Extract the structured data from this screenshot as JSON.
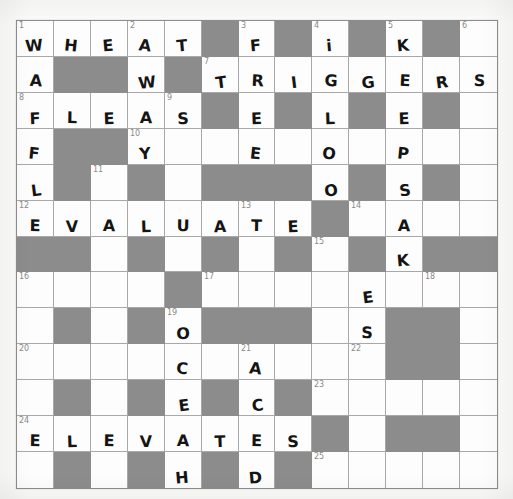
{
  "puzzle": {
    "kind": "crossword-grid",
    "columns": 13,
    "rows": 13,
    "cell_size": 37,
    "colors": {
      "block": "#8c8c8c",
      "open": "#fdfdfd",
      "grid_line": "#a8a8a8",
      "border": "#8d8d8d",
      "number": "#8a8a8a",
      "ink": "#141414",
      "paper": "#fbfbfa"
    },
    "grid": [
      [
        {
          "t": "open",
          "n": "1",
          "l": "W"
        },
        {
          "t": "open",
          "n": "",
          "l": "H"
        },
        {
          "t": "open",
          "n": "",
          "l": "E"
        },
        {
          "t": "open",
          "n": "2",
          "l": "A"
        },
        {
          "t": "open",
          "n": "",
          "l": "T"
        },
        {
          "t": "block",
          "n": "",
          "l": ""
        },
        {
          "t": "open",
          "n": "3",
          "l": "F"
        },
        {
          "t": "block",
          "n": "",
          "l": ""
        },
        {
          "t": "open",
          "n": "4",
          "l": "i"
        },
        {
          "t": "block",
          "n": "",
          "l": ""
        },
        {
          "t": "open",
          "n": "5",
          "l": "K"
        },
        {
          "t": "block",
          "n": "",
          "l": ""
        },
        {
          "t": "open",
          "n": "6",
          "l": ""
        }
      ],
      [
        {
          "t": "open",
          "n": "",
          "l": "A"
        },
        {
          "t": "block",
          "n": "",
          "l": ""
        },
        {
          "t": "block",
          "n": "",
          "l": ""
        },
        {
          "t": "open",
          "n": "",
          "l": "W"
        },
        {
          "t": "block",
          "n": "",
          "l": ""
        },
        {
          "t": "open",
          "n": "7",
          "l": "T"
        },
        {
          "t": "open",
          "n": "",
          "l": "R"
        },
        {
          "t": "open",
          "n": "",
          "l": "I"
        },
        {
          "t": "open",
          "n": "",
          "l": "G"
        },
        {
          "t": "open",
          "n": "",
          "l": "G"
        },
        {
          "t": "open",
          "n": "",
          "l": "E"
        },
        {
          "t": "open",
          "n": "",
          "l": "R"
        },
        {
          "t": "open",
          "n": "",
          "l": "S"
        }
      ],
      [
        {
          "t": "open",
          "n": "8",
          "l": "F"
        },
        {
          "t": "open",
          "n": "",
          "l": "L"
        },
        {
          "t": "open",
          "n": "",
          "l": "E"
        },
        {
          "t": "open",
          "n": "",
          "l": "A"
        },
        {
          "t": "open",
          "n": "9",
          "l": "S"
        },
        {
          "t": "block",
          "n": "",
          "l": ""
        },
        {
          "t": "open",
          "n": "",
          "l": "E"
        },
        {
          "t": "block",
          "n": "",
          "l": ""
        },
        {
          "t": "open",
          "n": "",
          "l": "L"
        },
        {
          "t": "block",
          "n": "",
          "l": ""
        },
        {
          "t": "open",
          "n": "",
          "l": "E"
        },
        {
          "t": "block",
          "n": "",
          "l": ""
        },
        {
          "t": "open",
          "n": "",
          "l": ""
        }
      ],
      [
        {
          "t": "open",
          "n": "",
          "l": "F"
        },
        {
          "t": "block",
          "n": "",
          "l": ""
        },
        {
          "t": "block",
          "n": "",
          "l": ""
        },
        {
          "t": "open",
          "n": "10",
          "l": "Y"
        },
        {
          "t": "open",
          "n": "",
          "l": ""
        },
        {
          "t": "open",
          "n": "",
          "l": ""
        },
        {
          "t": "open",
          "n": "",
          "l": "E"
        },
        {
          "t": "open",
          "n": "",
          "l": ""
        },
        {
          "t": "open",
          "n": "",
          "l": "O"
        },
        {
          "t": "open",
          "n": "",
          "l": ""
        },
        {
          "t": "open",
          "n": "",
          "l": "P"
        },
        {
          "t": "open",
          "n": "",
          "l": ""
        },
        {
          "t": "open",
          "n": "",
          "l": ""
        }
      ],
      [
        {
          "t": "open",
          "n": "",
          "l": "L"
        },
        {
          "t": "block",
          "n": "",
          "l": ""
        },
        {
          "t": "open",
          "n": "11",
          "l": ""
        },
        {
          "t": "block",
          "n": "",
          "l": ""
        },
        {
          "t": "open",
          "n": "",
          "l": ""
        },
        {
          "t": "block",
          "n": "",
          "l": ""
        },
        {
          "t": "block",
          "n": "",
          "l": ""
        },
        {
          "t": "block",
          "n": "",
          "l": ""
        },
        {
          "t": "open",
          "n": "",
          "l": "O"
        },
        {
          "t": "block",
          "n": "",
          "l": ""
        },
        {
          "t": "open",
          "n": "",
          "l": "S"
        },
        {
          "t": "block",
          "n": "",
          "l": ""
        },
        {
          "t": "open",
          "n": "",
          "l": ""
        }
      ],
      [
        {
          "t": "open",
          "n": "12",
          "l": "E"
        },
        {
          "t": "open",
          "n": "",
          "l": "V"
        },
        {
          "t": "open",
          "n": "",
          "l": "A"
        },
        {
          "t": "open",
          "n": "",
          "l": "L"
        },
        {
          "t": "open",
          "n": "",
          "l": "U"
        },
        {
          "t": "open",
          "n": "",
          "l": "A"
        },
        {
          "t": "open",
          "n": "13",
          "l": "T"
        },
        {
          "t": "open",
          "n": "",
          "l": "E"
        },
        {
          "t": "block",
          "n": "",
          "l": ""
        },
        {
          "t": "open",
          "n": "14",
          "l": ""
        },
        {
          "t": "open",
          "n": "",
          "l": "A"
        },
        {
          "t": "open",
          "n": "",
          "l": ""
        },
        {
          "t": "open",
          "n": "",
          "l": ""
        }
      ],
      [
        {
          "t": "block",
          "n": "",
          "l": ""
        },
        {
          "t": "block",
          "n": "",
          "l": ""
        },
        {
          "t": "open",
          "n": "",
          "l": ""
        },
        {
          "t": "block",
          "n": "",
          "l": ""
        },
        {
          "t": "open",
          "n": "",
          "l": ""
        },
        {
          "t": "block",
          "n": "",
          "l": ""
        },
        {
          "t": "open",
          "n": "",
          "l": ""
        },
        {
          "t": "block",
          "n": "",
          "l": ""
        },
        {
          "t": "open",
          "n": "15",
          "l": ""
        },
        {
          "t": "block",
          "n": "",
          "l": ""
        },
        {
          "t": "open",
          "n": "",
          "l": "K"
        },
        {
          "t": "block",
          "n": "",
          "l": ""
        },
        {
          "t": "block",
          "n": "",
          "l": ""
        }
      ],
      [
        {
          "t": "open",
          "n": "16",
          "l": ""
        },
        {
          "t": "open",
          "n": "",
          "l": ""
        },
        {
          "t": "open",
          "n": "",
          "l": ""
        },
        {
          "t": "open",
          "n": "",
          "l": ""
        },
        {
          "t": "block",
          "n": "",
          "l": ""
        },
        {
          "t": "open",
          "n": "17",
          "l": ""
        },
        {
          "t": "open",
          "n": "",
          "l": ""
        },
        {
          "t": "open",
          "n": "",
          "l": ""
        },
        {
          "t": "open",
          "n": "",
          "l": ""
        },
        {
          "t": "open",
          "n": "",
          "l": "E"
        },
        {
          "t": "open",
          "n": "",
          "l": ""
        },
        {
          "t": "open",
          "n": "18",
          "l": ""
        },
        {
          "t": "open",
          "n": "",
          "l": ""
        }
      ],
      [
        {
          "t": "open",
          "n": "",
          "l": ""
        },
        {
          "t": "block",
          "n": "",
          "l": ""
        },
        {
          "t": "open",
          "n": "",
          "l": ""
        },
        {
          "t": "block",
          "n": "",
          "l": ""
        },
        {
          "t": "open",
          "n": "19",
          "l": "O"
        },
        {
          "t": "block",
          "n": "",
          "l": ""
        },
        {
          "t": "block",
          "n": "",
          "l": ""
        },
        {
          "t": "block",
          "n": "",
          "l": ""
        },
        {
          "t": "open",
          "n": "",
          "l": ""
        },
        {
          "t": "open",
          "n": "",
          "l": "S"
        },
        {
          "t": "block",
          "n": "",
          "l": ""
        },
        {
          "t": "block",
          "n": "",
          "l": ""
        },
        {
          "t": "open",
          "n": "",
          "l": ""
        }
      ],
      [
        {
          "t": "open",
          "n": "20",
          "l": ""
        },
        {
          "t": "open",
          "n": "",
          "l": ""
        },
        {
          "t": "open",
          "n": "",
          "l": ""
        },
        {
          "t": "open",
          "n": "",
          "l": ""
        },
        {
          "t": "open",
          "n": "",
          "l": "C"
        },
        {
          "t": "open",
          "n": "",
          "l": ""
        },
        {
          "t": "open",
          "n": "21",
          "l": "A"
        },
        {
          "t": "open",
          "n": "",
          "l": ""
        },
        {
          "t": "open",
          "n": "",
          "l": ""
        },
        {
          "t": "open",
          "n": "22",
          "l": ""
        },
        {
          "t": "block",
          "n": "",
          "l": ""
        },
        {
          "t": "block",
          "n": "",
          "l": ""
        },
        {
          "t": "open",
          "n": "",
          "l": ""
        }
      ],
      [
        {
          "t": "open",
          "n": "",
          "l": ""
        },
        {
          "t": "block",
          "n": "",
          "l": ""
        },
        {
          "t": "open",
          "n": "",
          "l": ""
        },
        {
          "t": "block",
          "n": "",
          "l": ""
        },
        {
          "t": "open",
          "n": "",
          "l": "E"
        },
        {
          "t": "block",
          "n": "",
          "l": ""
        },
        {
          "t": "open",
          "n": "",
          "l": "C"
        },
        {
          "t": "block",
          "n": "",
          "l": ""
        },
        {
          "t": "open",
          "n": "23",
          "l": ""
        },
        {
          "t": "open",
          "n": "",
          "l": ""
        },
        {
          "t": "open",
          "n": "",
          "l": ""
        },
        {
          "t": "open",
          "n": "",
          "l": ""
        },
        {
          "t": "open",
          "n": "",
          "l": ""
        }
      ],
      [
        {
          "t": "open",
          "n": "24",
          "l": "E"
        },
        {
          "t": "open",
          "n": "",
          "l": "L"
        },
        {
          "t": "open",
          "n": "",
          "l": "E"
        },
        {
          "t": "open",
          "n": "",
          "l": "V"
        },
        {
          "t": "open",
          "n": "",
          "l": "A"
        },
        {
          "t": "open",
          "n": "",
          "l": "T"
        },
        {
          "t": "open",
          "n": "",
          "l": "E"
        },
        {
          "t": "open",
          "n": "",
          "l": "S"
        },
        {
          "t": "block",
          "n": "",
          "l": ""
        },
        {
          "t": "open",
          "n": "",
          "l": ""
        },
        {
          "t": "block",
          "n": "",
          "l": ""
        },
        {
          "t": "block",
          "n": "",
          "l": ""
        },
        {
          "t": "open",
          "n": "",
          "l": ""
        }
      ],
      [
        {
          "t": "open",
          "n": "",
          "l": ""
        },
        {
          "t": "block",
          "n": "",
          "l": ""
        },
        {
          "t": "open",
          "n": "",
          "l": ""
        },
        {
          "t": "block",
          "n": "",
          "l": ""
        },
        {
          "t": "open",
          "n": "",
          "l": "H"
        },
        {
          "t": "block",
          "n": "",
          "l": ""
        },
        {
          "t": "open",
          "n": "",
          "l": "D"
        },
        {
          "t": "block",
          "n": "",
          "l": ""
        },
        {
          "t": "open",
          "n": "25",
          "l": ""
        },
        {
          "t": "open",
          "n": "",
          "l": ""
        },
        {
          "t": "open",
          "n": "",
          "l": ""
        },
        {
          "t": "open",
          "n": "",
          "l": ""
        },
        {
          "t": "open",
          "n": "",
          "l": ""
        }
      ]
    ]
  }
}
